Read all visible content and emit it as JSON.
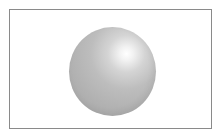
{
  "figure": {
    "colors": {
      "border": "#8a8a8a",
      "background": "#ffffff",
      "sphere_base": "#b2b2b2",
      "highlight": "#ffffff"
    }
  }
}
